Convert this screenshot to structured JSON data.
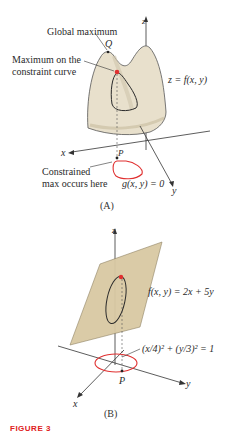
{
  "panel_a": {
    "caption": "(A)",
    "labels": {
      "global_max": "Global maximum",
      "point_q": "Q",
      "max_constraint_line1": "Maximum on the",
      "max_constraint_line2": "constraint curve",
      "surface": "z = f(x, y)",
      "point_p": "P",
      "constrained_line1": "Constrained",
      "constrained_line2": "max occurs here",
      "constraint": "g(x, y) = 0",
      "axis_x": "x",
      "axis_y": "y",
      "axis_z": "z"
    }
  },
  "panel_b": {
    "caption": "(B)",
    "labels": {
      "function": "f(x, y) = 2x + 5y",
      "constraint": "(x/4)² + (y/3)² = 1",
      "point_p": "P",
      "axis_x": "x",
      "axis_y": "y",
      "axis_z": "z"
    }
  },
  "figure_label": "FIGURE 3",
  "colors": {
    "surface": "#e8e0cc",
    "plane": "#d9c9a3",
    "constraint_curve": "#e03030",
    "curve": "#2a2a2a",
    "figure_label": "#e02020"
  }
}
